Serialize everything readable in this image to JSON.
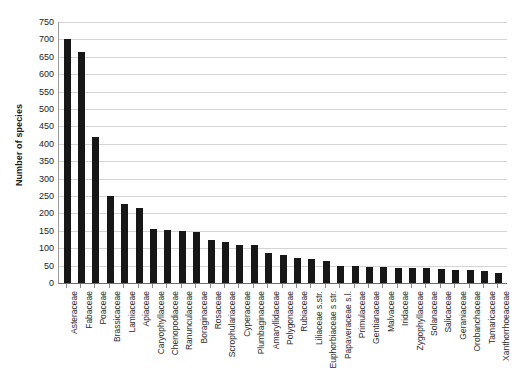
{
  "chart_data": {
    "type": "bar",
    "title": "",
    "subtitle": "",
    "xlabel": "",
    "ylabel": "Number of species",
    "ylim": [
      0,
      750
    ],
    "ytick_step": 50,
    "yticks": [
      0,
      50,
      100,
      150,
      200,
      250,
      300,
      350,
      400,
      450,
      500,
      550,
      600,
      650,
      700,
      750
    ],
    "grid": true,
    "legend": null,
    "legend_position": "none",
    "bar_color": "#171717",
    "gridline_color": "#d4d4d4",
    "axis_color": "#6e6e6e",
    "categories": [
      "Asteraceae",
      "Fabaceae",
      "Poaceae",
      "Brassicaceae",
      "Lamiaceae",
      "Apiaceae",
      "Caryophyllaceae",
      "Chenopodiaceae",
      "Ranunculaceae",
      "Boraginaceae",
      "Rosaceae",
      "Scrophulariaceae",
      "Cyperaceae",
      "Plumbaginaceae",
      "Amaryllidaceae",
      "Polygonaceae",
      "Rubiaceae",
      "Liliaceae s.str.",
      "Euphorbiaceae s str.",
      "Papaveraceae s.l.",
      "Primulaceae",
      "Gentianaceae",
      "Malvaceae",
      "Iridaceae",
      "Zygophyllaceae",
      "Solanaceae",
      "Salicaceae",
      "Geraniaceae",
      "Orobanchaceae",
      "Tamaricaceae",
      "Xanthorrhoeaceae"
    ],
    "values": [
      702,
      665,
      420,
      250,
      228,
      215,
      155,
      153,
      150,
      148,
      125,
      118,
      110,
      108,
      85,
      80,
      72,
      70,
      62,
      50,
      48,
      46,
      45,
      43,
      42,
      42,
      40,
      38,
      36,
      34,
      30
    ]
  }
}
